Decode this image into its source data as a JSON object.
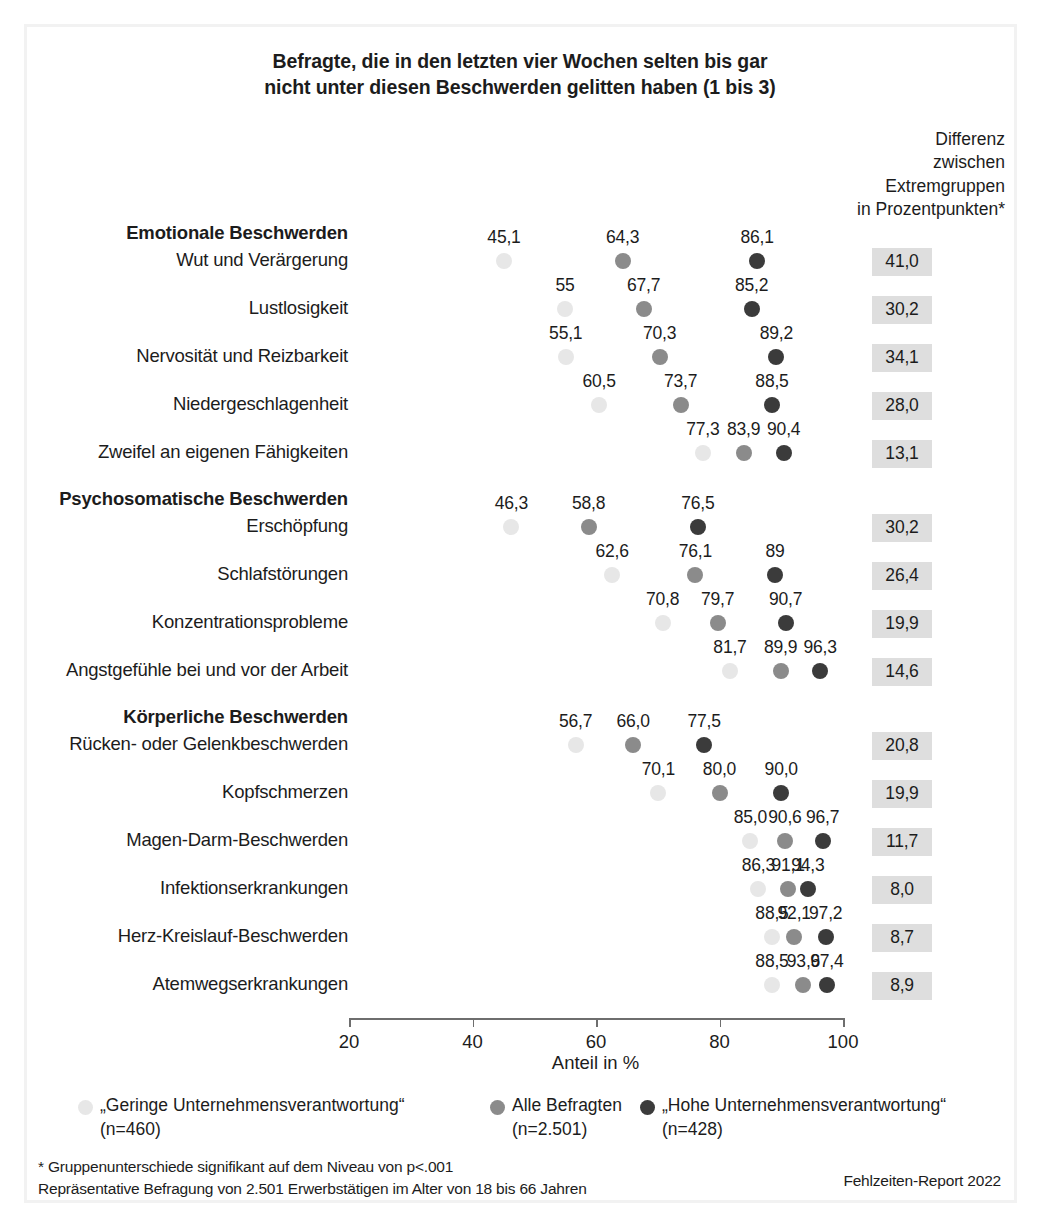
{
  "title": "Befragte, die in den letzten vier Wochen selten bis gar nicht unter diesen Beschwerden gelitten haben (1 bis 3)",
  "title_line1": "Befragte, die in den letzten vier Wochen selten bis gar",
  "title_line2": "nicht unter diesen Beschwerden gelitten haben (1 bis 3)",
  "diff_header": {
    "line1": "Differenz",
    "line2": "zwischen",
    "line3": "Extremgruppen",
    "line4": "in Prozentpunkten*"
  },
  "axis": {
    "title": "Anteil in %",
    "ticks": [
      "20",
      "40",
      "60",
      "80",
      "100"
    ],
    "min": 20,
    "max": 100
  },
  "legend": [
    {
      "key": "low",
      "label": "„Geringe Unternehmensverantwortung“",
      "n": "(n=460)",
      "color": "#e7e7e7"
    },
    {
      "key": "all",
      "label": "Alle Befragten",
      "n": "(n=2.501)",
      "color": "#8b8b8b"
    },
    {
      "key": "high",
      "label": "„Hohe Unternehmensverantwortung“",
      "n": "(n=428)",
      "color": "#3b3b3b"
    }
  ],
  "footnotes": {
    "line1": "* Gruppenunterschiede signifikant auf dem Niveau von p<.001",
    "line2": "Repräsentative Befragung von 2.501 Erwerbstätigen im Alter von 18 bis 66 Jahren",
    "source": "Fehlzeiten-Report 2022"
  },
  "chart_data": {
    "type": "scatter",
    "title": "Befragte, die in den letzten vier Wochen selten bis gar nicht unter diesen Beschwerden gelitten haben (1 bis 3)",
    "xlabel": "Anteil in %",
    "ylabel": "",
    "xlim": [
      20,
      100
    ],
    "xticks": [
      20,
      40,
      60,
      80,
      100
    ],
    "grid": false,
    "legend_position": "bottom",
    "series": [
      {
        "name": "„Geringe Unternehmensverantwortung“ (n=460)",
        "key": "low",
        "color": "#e7e7e7"
      },
      {
        "name": "Alle Befragten (n=2.501)",
        "key": "all",
        "color": "#8b8b8b"
      },
      {
        "name": "„Hohe Unternehmensverantwortung“ (n=428)",
        "key": "high",
        "color": "#3b3b3b"
      }
    ],
    "groups": [
      {
        "group": "Emotionale Beschwerden",
        "rows": [
          {
            "label": "Wut und Verärgerung",
            "low": 45.1,
            "all": 64.3,
            "high": 86.1,
            "low_text": "45,1",
            "all_text": "64,3",
            "high_text": "86,1",
            "diff": "41,0"
          },
          {
            "label": "Lustlosigkeit",
            "low": 55.0,
            "all": 67.7,
            "high": 85.2,
            "low_text": "55",
            "all_text": "67,7",
            "high_text": "85,2",
            "diff": "30,2"
          },
          {
            "label": "Nervosität und Reizbarkeit",
            "low": 55.1,
            "all": 70.3,
            "high": 89.2,
            "low_text": "55,1",
            "all_text": "70,3",
            "high_text": "89,2",
            "diff": "34,1"
          },
          {
            "label": "Niedergeschlagenheit",
            "low": 60.5,
            "all": 73.7,
            "high": 88.5,
            "low_text": "60,5",
            "all_text": "73,7",
            "high_text": "88,5",
            "diff": "28,0"
          },
          {
            "label": "Zweifel an eigenen Fähigkeiten",
            "low": 77.3,
            "all": 83.9,
            "high": 90.4,
            "low_text": "77,3",
            "all_text": "83,9",
            "high_text": "90,4",
            "diff": "13,1"
          }
        ]
      },
      {
        "group": "Psychosomatische Beschwerden",
        "rows": [
          {
            "label": "Erschöpfung",
            "low": 46.3,
            "all": 58.8,
            "high": 76.5,
            "low_text": "46,3",
            "all_text": "58,8",
            "high_text": "76,5",
            "diff": "30,2"
          },
          {
            "label": "Schlafstörungen",
            "low": 62.6,
            "all": 76.1,
            "high": 89.0,
            "low_text": "62,6",
            "all_text": "76,1",
            "high_text": "89",
            "diff": "26,4"
          },
          {
            "label": "Konzentrationsprobleme",
            "low": 70.8,
            "all": 79.7,
            "high": 90.7,
            "low_text": "70,8",
            "all_text": "79,7",
            "high_text": "90,7",
            "diff": "19,9"
          },
          {
            "label": "Angstgefühle bei und vor der Arbeit",
            "low": 81.7,
            "all": 89.9,
            "high": 96.3,
            "low_text": "81,7",
            "all_text": "89,9",
            "high_text": "96,3",
            "diff": "14,6"
          }
        ]
      },
      {
        "group": "Körperliche Beschwerden",
        "rows": [
          {
            "label": "Rücken- oder Gelenkbeschwerden",
            "low": 56.7,
            "all": 66.0,
            "high": 77.5,
            "low_text": "56,7",
            "all_text": "66,0",
            "high_text": "77,5",
            "diff": "20,8"
          },
          {
            "label": "Kopfschmerzen",
            "low": 70.1,
            "all": 80.0,
            "high": 90.0,
            "low_text": "70,1",
            "all_text": "80,0",
            "high_text": "90,0",
            "diff": "19,9"
          },
          {
            "label": "Magen-Darm-Beschwerden",
            "low": 85.0,
            "all": 90.6,
            "high": 96.7,
            "low_text": "85,0",
            "all_text": "90,6",
            "high_text": "96,7",
            "diff": "11,7"
          },
          {
            "label": "Infektionserkrankungen",
            "low": 86.3,
            "all": 91.1,
            "high": 94.3,
            "low_text": "86,3",
            "all_text": "91,1",
            "high_text": "94,3",
            "diff": "8,0"
          },
          {
            "label": "Herz-Kreislauf-Beschwerden",
            "low": 88.5,
            "all": 92.1,
            "high": 97.2,
            "low_text": "88,5",
            "all_text": "92,1",
            "high_text": "97,2",
            "diff": "8,7"
          },
          {
            "label": "Atemwegserkrankungen",
            "low": 88.5,
            "all": 93.6,
            "high": 97.4,
            "low_text": "88,5",
            "all_text": "93,6",
            "high_text": "97,4",
            "diff": "8,9"
          }
        ]
      }
    ]
  }
}
